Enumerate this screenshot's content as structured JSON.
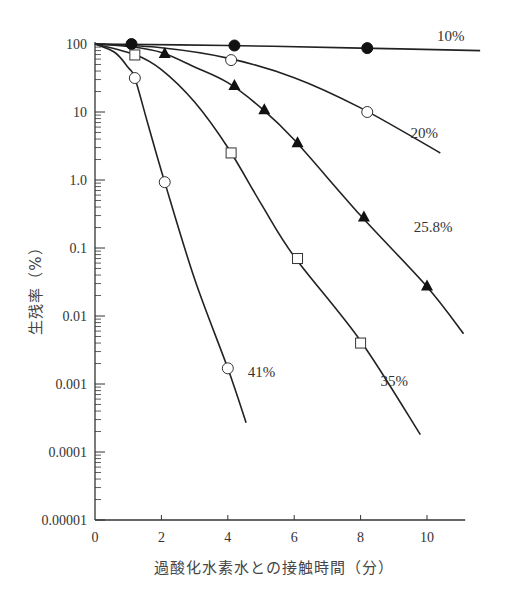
{
  "chart_data": {
    "type": "line",
    "title": "",
    "xlabel": "過酸化水素水との接触時間（分）",
    "ylabel": "生残率（%）",
    "yscale": "log",
    "xlim": [
      0,
      11
    ],
    "ylim": [
      1e-05,
      100
    ],
    "grid": false,
    "x_ticks": [
      0,
      2,
      4,
      6,
      8,
      10
    ],
    "x_tick_labels": [
      "0",
      "2",
      "4",
      "6",
      "8",
      "10"
    ],
    "y_ticks": [
      100,
      10,
      1,
      0.1,
      0.01,
      0.001,
      0.0001,
      1e-05
    ],
    "y_tick_labels": [
      "100",
      "10",
      "1.0",
      "0.1",
      "0.01",
      "0.001",
      "0.0001",
      "0.00001"
    ],
    "legend": "inline labels at curve ends",
    "series": [
      {
        "name": "10%",
        "marker": "filled-circle",
        "points": [
          [
            1.1,
            100
          ],
          [
            4.2,
            95
          ],
          [
            8.2,
            87
          ]
        ],
        "curve": [
          [
            0,
            100
          ],
          [
            4,
            95
          ],
          [
            8,
            87
          ],
          [
            11.6,
            80
          ]
        ],
        "label_pos": [
          10.3,
          110
        ]
      },
      {
        "name": "20%",
        "marker": "open-circle",
        "points": [
          [
            4.1,
            58
          ],
          [
            8.2,
            10
          ]
        ],
        "curve": [
          [
            0,
            100
          ],
          [
            2,
            88
          ],
          [
            4,
            62
          ],
          [
            6,
            32
          ],
          [
            8,
            11.5
          ],
          [
            10.4,
            2.5
          ]
        ],
        "label_pos": [
          9.5,
          4.2
        ]
      },
      {
        "name": "25.8%",
        "marker": "filled-triangle",
        "points": [
          [
            2.1,
            74
          ],
          [
            4.2,
            25
          ],
          [
            5.1,
            11
          ],
          [
            6.1,
            3.6
          ],
          [
            8.1,
            0.29
          ],
          [
            10.0,
            0.028
          ]
        ],
        "curve": [
          [
            0,
            100
          ],
          [
            1,
            92
          ],
          [
            2,
            75
          ],
          [
            3,
            46
          ],
          [
            4,
            27
          ],
          [
            5,
            11.5
          ],
          [
            6,
            3.9
          ],
          [
            8,
            0.3
          ],
          [
            10,
            0.027
          ],
          [
            11.1,
            0.0055
          ]
        ],
        "label_pos": [
          9.6,
          0.17
        ]
      },
      {
        "name": "35%",
        "marker": "open-square",
        "points": [
          [
            1.2,
            69
          ],
          [
            4.1,
            2.5
          ],
          [
            6.1,
            0.07
          ],
          [
            8.0,
            0.004
          ]
        ],
        "curve": [
          [
            0,
            100
          ],
          [
            1.2,
            70
          ],
          [
            2,
            42
          ],
          [
            3,
            14
          ],
          [
            4,
            3.0
          ],
          [
            5,
            0.45
          ],
          [
            6,
            0.075
          ],
          [
            8,
            0.0043
          ],
          [
            9.8,
            0.00018
          ]
        ],
        "label_pos": [
          8.6,
          0.00095
        ]
      },
      {
        "name": "41%",
        "marker": "open-circle",
        "points": [
          [
            1.2,
            31.6
          ],
          [
            2.1,
            0.93
          ],
          [
            4.0,
            0.0017
          ]
        ],
        "curve": [
          [
            0,
            100
          ],
          [
            0.6,
            75
          ],
          [
            1.0,
            45
          ],
          [
            1.2,
            31.6
          ],
          [
            1.6,
            6.5
          ],
          [
            2.1,
            0.93
          ],
          [
            3,
            0.035
          ],
          [
            4,
            0.0017
          ],
          [
            4.55,
            0.00027
          ]
        ],
        "label_pos": [
          4.6,
          0.00125
        ]
      }
    ]
  }
}
